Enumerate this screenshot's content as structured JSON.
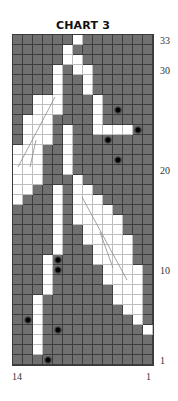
{
  "title": "CHART 3",
  "row_labels": [
    {
      "text": "33",
      "row": 33
    },
    {
      "text": "30",
      "row": 30
    },
    {
      "text": "20",
      "row": 20
    },
    {
      "text": "10",
      "row": 10
    },
    {
      "text": "1",
      "row": 1
    }
  ],
  "col_labels": [
    {
      "text": "14",
      "col": 0
    },
    {
      "text": "1",
      "col": 13
    }
  ],
  "colors": {
    "background_stitch": "#707070",
    "contrast_stitch": "#ffffff",
    "grid_line": "#3d3d3d",
    "bead_dot": "#000000"
  },
  "grid": {
    "columns": 14,
    "rows": 33,
    "white_cells_by_row": {
      "33": [
        6
      ],
      "32": [
        5
      ],
      "31": [
        5,
        6
      ],
      "30": [
        4,
        6,
        7
      ],
      "29": [
        4,
        7
      ],
      "28": [
        4,
        7
      ],
      "27": [
        2,
        3,
        4,
        8
      ],
      "26": [
        2,
        3,
        4,
        8
      ],
      "25": [
        1,
        2,
        3,
        8
      ],
      "24": [
        1,
        2,
        3,
        5,
        8,
        9,
        10,
        11
      ],
      "23": [
        1,
        2,
        3,
        5
      ],
      "22": [
        0,
        1,
        2,
        5
      ],
      "21": [
        0,
        1,
        2,
        5
      ],
      "20": [
        0,
        1,
        2,
        5
      ],
      "19": [
        0,
        1,
        2,
        6
      ],
      "18": [
        0,
        1,
        4,
        6,
        7
      ],
      "17": [
        0,
        4,
        6,
        7,
        8
      ],
      "16": [
        4,
        6,
        7,
        8,
        9
      ],
      "15": [
        4,
        6,
        7,
        8,
        9,
        10
      ],
      "14": [
        4,
        7,
        8,
        9,
        10
      ],
      "13": [
        4,
        7,
        8,
        9,
        10,
        11
      ],
      "12": [
        4,
        8,
        9,
        10,
        11
      ],
      "11": [
        3,
        8,
        9,
        10,
        11
      ],
      "10": [
        3,
        9,
        10,
        11,
        12
      ],
      "9": [
        3,
        9,
        10,
        11,
        12
      ],
      "8": [
        3,
        10,
        11,
        12
      ],
      "7": [
        2,
        10,
        11,
        12
      ],
      "6": [
        2,
        11,
        12
      ],
      "5": [
        2,
        12
      ],
      "4": [
        2,
        13
      ],
      "3": [
        2
      ],
      "2": [
        2
      ],
      "1": []
    },
    "dots": [
      {
        "row": 26,
        "col": 10
      },
      {
        "row": 24,
        "col": 12
      },
      {
        "row": 23,
        "col": 9
      },
      {
        "row": 21,
        "col": 10
      },
      {
        "row": 11,
        "col": 4
      },
      {
        "row": 10,
        "col": 4
      },
      {
        "row": 5,
        "col": 1
      },
      {
        "row": 4,
        "col": 4
      },
      {
        "row": 1,
        "col": 3
      }
    ],
    "leaf_vein_lines": [
      {
        "x1": 55,
        "y1": 97,
        "x2": 18,
        "y2": 167
      },
      {
        "x1": 36,
        "y1": 140,
        "x2": 30,
        "y2": 167
      },
      {
        "x1": 82,
        "y1": 197,
        "x2": 127,
        "y2": 280
      },
      {
        "x1": 100,
        "y1": 232,
        "x2": 113,
        "y2": 268
      }
    ]
  }
}
